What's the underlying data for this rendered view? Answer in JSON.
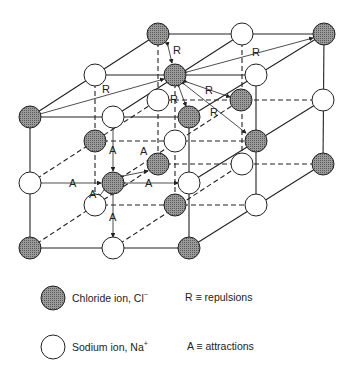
{
  "diagram": {
    "colors": {
      "chloride_fill": "#8a8a8a",
      "sodium_fill": "#ffffff",
      "stroke": "#222222",
      "background": "#ffffff"
    },
    "labels": {
      "repulsion": "R",
      "attraction": "A"
    },
    "layers": [
      {
        "name": "front",
        "ions": [
          {
            "x": 30,
            "y": 117,
            "type": "Cl"
          },
          {
            "x": 113,
            "y": 117,
            "type": "Na"
          },
          {
            "x": 189,
            "y": 117,
            "type": "Cl"
          },
          {
            "x": 30,
            "y": 183,
            "type": "Na"
          },
          {
            "x": 113,
            "y": 183,
            "type": "Cl"
          },
          {
            "x": 189,
            "y": 183,
            "type": "Na"
          },
          {
            "x": 30,
            "y": 248,
            "type": "Cl"
          },
          {
            "x": 113,
            "y": 248,
            "type": "Na"
          },
          {
            "x": 189,
            "y": 248,
            "type": "Cl"
          }
        ]
      },
      {
        "name": "middle",
        "ions": [
          {
            "x": 95,
            "y": 75,
            "type": "Na"
          },
          {
            "x": 175,
            "y": 75,
            "type": "Cl"
          },
          {
            "x": 256,
            "y": 75,
            "type": "Na"
          },
          {
            "x": 95,
            "y": 141,
            "type": "Cl"
          },
          {
            "x": 175,
            "y": 141,
            "type": "Na"
          },
          {
            "x": 256,
            "y": 141,
            "type": "Cl"
          },
          {
            "x": 95,
            "y": 205,
            "type": "Na"
          },
          {
            "x": 175,
            "y": 205,
            "type": "Cl"
          },
          {
            "x": 256,
            "y": 205,
            "type": "Na"
          }
        ]
      },
      {
        "name": "back",
        "ions": [
          {
            "x": 158,
            "y": 34,
            "type": "Cl"
          },
          {
            "x": 242,
            "y": 34,
            "type": "Na"
          },
          {
            "x": 324,
            "y": 34,
            "type": "Cl"
          },
          {
            "x": 158,
            "y": 100,
            "type": "Na"
          },
          {
            "x": 241,
            "y": 100,
            "type": "Cl"
          },
          {
            "x": 323,
            "y": 100,
            "type": "Na"
          },
          {
            "x": 158,
            "y": 164,
            "type": "Cl"
          },
          {
            "x": 242,
            "y": 164,
            "type": "Na"
          },
          {
            "x": 323,
            "y": 164,
            "type": "Cl"
          }
        ]
      }
    ]
  },
  "legend": {
    "chloride": {
      "label": "Chloride ion, Cl",
      "charge": "−"
    },
    "sodium": {
      "label": "Sodium ion, Na",
      "charge": "+"
    },
    "repulsions": "R ≡ repulsions",
    "attractions": "A ≡ attractions"
  }
}
